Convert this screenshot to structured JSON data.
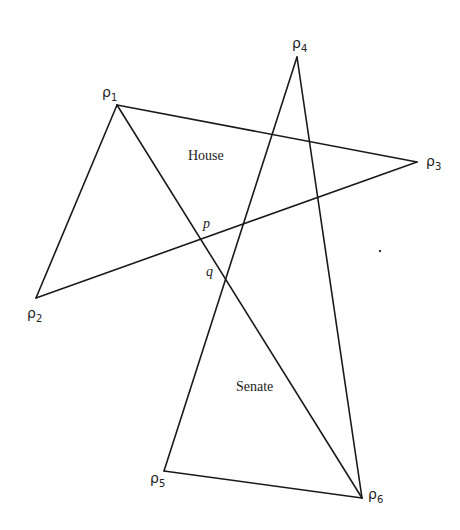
{
  "diagram": {
    "vertices": [
      {
        "id": "p1",
        "symbol": "ρ",
        "sub": "1",
        "x": 117,
        "y": 105,
        "lx": 102,
        "ly": 97
      },
      {
        "id": "p2",
        "symbol": "ρ",
        "sub": "2",
        "x": 36,
        "y": 298,
        "lx": 27,
        "ly": 318
      },
      {
        "id": "p3",
        "symbol": "ρ",
        "sub": "3",
        "x": 417,
        "y": 162,
        "lx": 426,
        "ly": 166
      },
      {
        "id": "p4",
        "symbol": "ρ",
        "sub": "4",
        "x": 297,
        "y": 57,
        "lx": 292,
        "ly": 48
      },
      {
        "id": "p5",
        "symbol": "ρ",
        "sub": "5",
        "x": 164,
        "y": 471,
        "lx": 150,
        "ly": 483
      },
      {
        "id": "p6",
        "symbol": "ρ",
        "sub": "6",
        "x": 362,
        "y": 498,
        "lx": 368,
        "ly": 499
      }
    ],
    "edges": [
      [
        "p1",
        "p2"
      ],
      [
        "p1",
        "p3"
      ],
      [
        "p1",
        "p6"
      ],
      [
        "p2",
        "p3"
      ],
      [
        "p4",
        "p5"
      ],
      [
        "p4",
        "p6"
      ],
      [
        "p5",
        "p6"
      ]
    ],
    "regions": [
      {
        "label": "House",
        "x": 188,
        "y": 160
      },
      {
        "label": "Senate",
        "x": 236,
        "y": 391
      }
    ],
    "points": [
      {
        "label": "p",
        "x": 203,
        "y": 228
      },
      {
        "label": "q",
        "x": 206,
        "y": 276
      }
    ],
    "stray_dot": {
      "x": 380,
      "y": 251
    }
  }
}
